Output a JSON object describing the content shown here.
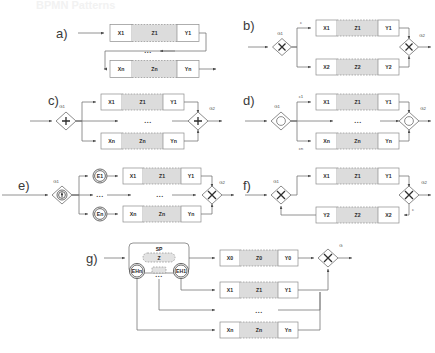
{
  "figure": {
    "title_watermark": "BPMN Patterns",
    "ellipsis": "...",
    "background_color": "#ffffff",
    "task_fill": "#ffffff",
    "middle_fill": "#dcdcdc",
    "stroke_color": "#6e6e6e"
  },
  "panels": [
    {
      "id": "a",
      "label": "a)",
      "pattern": "sequence-loop",
      "rows": [
        {
          "left": "X1",
          "middle": "Z1",
          "right": "Y1"
        },
        {
          "left": "Xn",
          "middle": "Zn",
          "right": "Yn"
        }
      ],
      "gateways": [],
      "edge_labels": [],
      "ellipsis": "..."
    },
    {
      "id": "b",
      "label": "b)",
      "pattern": "exclusive-split-join",
      "rows": [
        {
          "left": "X1",
          "middle": "Z1",
          "right": "Y1"
        },
        {
          "left": "X2",
          "middle": "Z2",
          "right": "Y2"
        }
      ],
      "gateways": [
        {
          "name": "G1",
          "kind": "exclusive",
          "glyph": "X"
        },
        {
          "name": "G2",
          "kind": "exclusive",
          "glyph": "X"
        }
      ],
      "edge_labels": [
        {
          "text": "c",
          "on": "top-branch"
        }
      ],
      "ellipsis": ""
    },
    {
      "id": "c",
      "label": "c)",
      "pattern": "parallel-split-join",
      "rows": [
        {
          "left": "X1",
          "middle": "Z1",
          "right": "Y1"
        },
        {
          "left": "Xn",
          "middle": "Zn",
          "right": "Yn"
        }
      ],
      "gateways": [
        {
          "name": "G1",
          "kind": "parallel",
          "glyph": "+"
        },
        {
          "name": "G2",
          "kind": "parallel",
          "glyph": "+"
        }
      ],
      "edge_labels": [],
      "ellipsis": "..."
    },
    {
      "id": "d",
      "label": "d)",
      "pattern": "inclusive-split-join",
      "rows": [
        {
          "left": "X1",
          "middle": "Z1",
          "right": "Y1"
        },
        {
          "left": "Xn",
          "middle": "Zn",
          "right": "Yn"
        }
      ],
      "gateways": [
        {
          "name": "G1",
          "kind": "inclusive",
          "glyph": "O"
        },
        {
          "name": "G2",
          "kind": "inclusive",
          "glyph": "O"
        }
      ],
      "edge_labels": [
        {
          "text": "c1",
          "on": "top-branch"
        },
        {
          "text": "cn",
          "on": "bottom-branch"
        }
      ],
      "ellipsis": "..."
    },
    {
      "id": "e",
      "label": "e)",
      "pattern": "event-based-split-join",
      "rows": [
        {
          "left": "X1",
          "middle": "Z1",
          "right": "Y1"
        },
        {
          "left": "Xn",
          "middle": "Zn",
          "right": "Yn"
        }
      ],
      "events": [
        "E1",
        "En"
      ],
      "gateways": [
        {
          "name": "G1",
          "kind": "event-based",
          "glyph": "star"
        },
        {
          "name": "G2",
          "kind": "exclusive",
          "glyph": "X"
        }
      ],
      "edge_labels": [],
      "ellipsis": "..."
    },
    {
      "id": "f",
      "label": "f)",
      "pattern": "structured-loop",
      "rows": [
        {
          "left": "X1",
          "middle": "Z1",
          "right": "Y1"
        },
        {
          "left": "Y2",
          "middle": "Z2",
          "right": "X2"
        }
      ],
      "gateways": [
        {
          "name": "G1",
          "kind": "exclusive",
          "glyph": "X"
        },
        {
          "name": "G2",
          "kind": "exclusive",
          "glyph": "X"
        }
      ],
      "edge_labels": [
        {
          "text": "c",
          "on": "loop-back"
        }
      ],
      "ellipsis": ""
    },
    {
      "id": "g",
      "label": "g)",
      "pattern": "subprocess-with-boundary-events",
      "subprocess": {
        "name": "SP",
        "inner_task": "Z",
        "boundary_events": [
          "EHn",
          "EH1"
        ],
        "ellipsis": "..."
      },
      "rows": [
        {
          "left": "X0",
          "middle": "Z0",
          "right": "Y0"
        },
        {
          "left": "X1",
          "middle": "Z1",
          "right": "Y1"
        },
        {
          "left": "Xn",
          "middle": "Zn",
          "right": "Yn"
        }
      ],
      "gateways": [
        {
          "name": "G",
          "kind": "exclusive",
          "glyph": "X"
        }
      ],
      "edge_labels": [],
      "ellipsis": "..."
    }
  ]
}
